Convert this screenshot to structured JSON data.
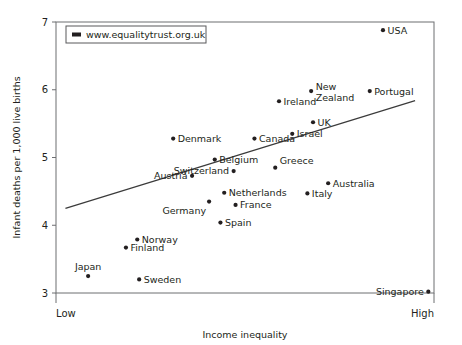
{
  "chart_data": {
    "type": "scatter",
    "title": "",
    "xlabel": "Income inequality",
    "ylabel": "Infant deaths per 1,000 live births",
    "x_tick_labels": [
      "Low",
      "High"
    ],
    "y_ticks": [
      3,
      4,
      5,
      6,
      7
    ],
    "ylim": [
      3,
      7
    ],
    "xlim": [
      0,
      100
    ],
    "grid": false,
    "legend": {
      "position": "top-left",
      "entries": [
        "www.equalitytrust.org.uk"
      ]
    },
    "trend_line": {
      "label": "regression line",
      "x_start": 2.5,
      "y_start": 4.25,
      "x_end": 95.0,
      "y_end": 5.84
    },
    "points": [
      {
        "label": "Japan",
        "x": 8.5,
        "y": 3.25,
        "label_pos": "above"
      },
      {
        "label": "Sweden",
        "x": 22.0,
        "y": 3.2,
        "label_pos": "right"
      },
      {
        "label": "Finland",
        "x": 18.5,
        "y": 3.67,
        "label_pos": "right"
      },
      {
        "label": "Norway",
        "x": 21.5,
        "y": 3.79,
        "label_pos": "right"
      },
      {
        "label": "Spain",
        "x": 43.5,
        "y": 4.04,
        "label_pos": "right"
      },
      {
        "label": "Germany",
        "x": 40.5,
        "y": 4.35,
        "label_pos": "below-left"
      },
      {
        "label": "France",
        "x": 47.5,
        "y": 4.3,
        "label_pos": "right"
      },
      {
        "label": "Netherlands",
        "x": 44.5,
        "y": 4.48,
        "label_pos": "right"
      },
      {
        "label": "Austria",
        "x": 36.0,
        "y": 4.73,
        "label_pos": "left"
      },
      {
        "label": "Switzerland",
        "x": 47.0,
        "y": 4.8,
        "label_pos": "left"
      },
      {
        "label": "Belgium",
        "x": 42.0,
        "y": 4.97,
        "label_pos": "right"
      },
      {
        "label": "Denmark",
        "x": 31.0,
        "y": 5.28,
        "label_pos": "right"
      },
      {
        "label": "Canada",
        "x": 52.5,
        "y": 5.28,
        "label_pos": "right"
      },
      {
        "label": "Greece",
        "x": 58.0,
        "y": 4.85,
        "label_pos": "above-right"
      },
      {
        "label": "Italy",
        "x": 66.5,
        "y": 4.47,
        "label_pos": "right"
      },
      {
        "label": "Australia",
        "x": 72.0,
        "y": 4.62,
        "label_pos": "right"
      },
      {
        "label": "Israel",
        "x": 62.5,
        "y": 5.35,
        "label_pos": "right"
      },
      {
        "label": "UK",
        "x": 68.0,
        "y": 5.52,
        "label_pos": "right"
      },
      {
        "label": "Ireland",
        "x": 59.0,
        "y": 5.83,
        "label_pos": "right"
      },
      {
        "label": "New Zealand",
        "x": 67.5,
        "y": 5.98,
        "label_pos": "right"
      },
      {
        "label": "Portugal",
        "x": 83.0,
        "y": 5.98,
        "label_pos": "right"
      },
      {
        "label": "USA",
        "x": 86.5,
        "y": 6.88,
        "label_pos": "right"
      },
      {
        "label": "Singapore",
        "x": 98.5,
        "y": 3.02,
        "label_pos": "left"
      }
    ]
  }
}
